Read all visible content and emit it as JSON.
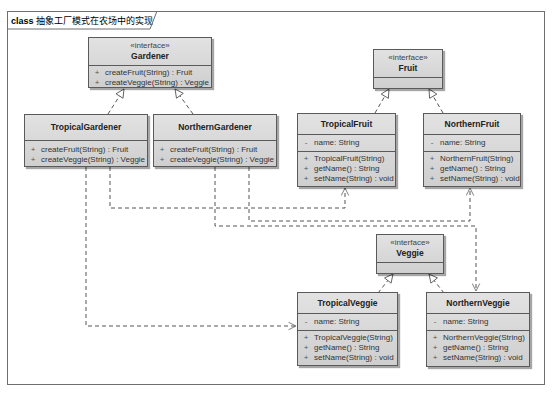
{
  "frame": {
    "keyword": "class",
    "title": "抽象工厂模式在农场中的实现"
  },
  "classes": {
    "gardener": {
      "stereotype": "«interface»",
      "name": "Gardener",
      "attributes": [],
      "operations": [
        {
          "vis": "+",
          "text": "createFruit(String) : Fruit"
        },
        {
          "vis": "+",
          "text": "createVeggie(String) : Veggie"
        }
      ]
    },
    "tropical_gardener": {
      "name": "TropicalGardener",
      "operations": [
        {
          "vis": "+",
          "text": "createFruit(String) : Fruit"
        },
        {
          "vis": "+",
          "text": "createVeggie(String) : Veggie"
        }
      ]
    },
    "northern_gardener": {
      "name": "NorthernGardener",
      "operations": [
        {
          "vis": "+",
          "text": "createFruit(String) : Fruit"
        },
        {
          "vis": "+",
          "text": "createVeggie(String) : Veggie"
        }
      ]
    },
    "fruit": {
      "stereotype": "«interface»",
      "name": "Fruit"
    },
    "tropical_fruit": {
      "name": "TropicalFruit",
      "attributes": [
        {
          "vis": "-",
          "text": "name:  String"
        }
      ],
      "operations": [
        {
          "vis": "+",
          "text": "TropicalFruit(String)"
        },
        {
          "vis": "+",
          "text": "getName() : String"
        },
        {
          "vis": "+",
          "text": "setName(String) : void"
        }
      ]
    },
    "northern_fruit": {
      "name": "NorthernFruit",
      "attributes": [
        {
          "vis": "-",
          "text": "name:  String"
        }
      ],
      "operations": [
        {
          "vis": "+",
          "text": "NorthernFruit(String)"
        },
        {
          "vis": "+",
          "text": "getName() : String"
        },
        {
          "vis": "+",
          "text": "setName(String) : void"
        }
      ]
    },
    "veggie": {
      "stereotype": "«interface»",
      "name": "Veggie"
    },
    "tropical_veggie": {
      "name": "TropicalVeggie",
      "attributes": [
        {
          "vis": "-",
          "text": "name:  String"
        }
      ],
      "operations": [
        {
          "vis": "+",
          "text": "TropicalVeggie(String)"
        },
        {
          "vis": "+",
          "text": "getName() : String"
        },
        {
          "vis": "+",
          "text": "setName(String) : void"
        }
      ]
    },
    "northern_veggie": {
      "name": "NorthernVeggie",
      "attributes": [
        {
          "vis": "-",
          "text": "name:  String"
        }
      ],
      "operations": [
        {
          "vis": "+",
          "text": "NorthernVeggie(String)"
        },
        {
          "vis": "+",
          "text": "getName() : String"
        },
        {
          "vis": "+",
          "text": "setName(String) : void"
        }
      ]
    }
  },
  "relationships": [
    {
      "type": "realization",
      "from": "TropicalGardener",
      "to": "Gardener"
    },
    {
      "type": "realization",
      "from": "NorthernGardener",
      "to": "Gardener"
    },
    {
      "type": "realization",
      "from": "TropicalFruit",
      "to": "Fruit"
    },
    {
      "type": "realization",
      "from": "NorthernFruit",
      "to": "Fruit"
    },
    {
      "type": "realization",
      "from": "TropicalVeggie",
      "to": "Veggie"
    },
    {
      "type": "realization",
      "from": "NorthernVeggie",
      "to": "Veggie"
    },
    {
      "type": "dependency",
      "from": "TropicalGardener",
      "to": "TropicalFruit"
    },
    {
      "type": "dependency",
      "from": "TropicalGardener",
      "to": "TropicalVeggie"
    },
    {
      "type": "dependency",
      "from": "NorthernGardener",
      "to": "NorthernFruit"
    },
    {
      "type": "dependency",
      "from": "NorthernGardener",
      "to": "NorthernVeggie"
    }
  ],
  "colors": {
    "box_fill_top": "#e2e2e2",
    "box_fill_bottom": "#cfcfcf",
    "border": "#5a5a5a",
    "line": "#555555"
  }
}
